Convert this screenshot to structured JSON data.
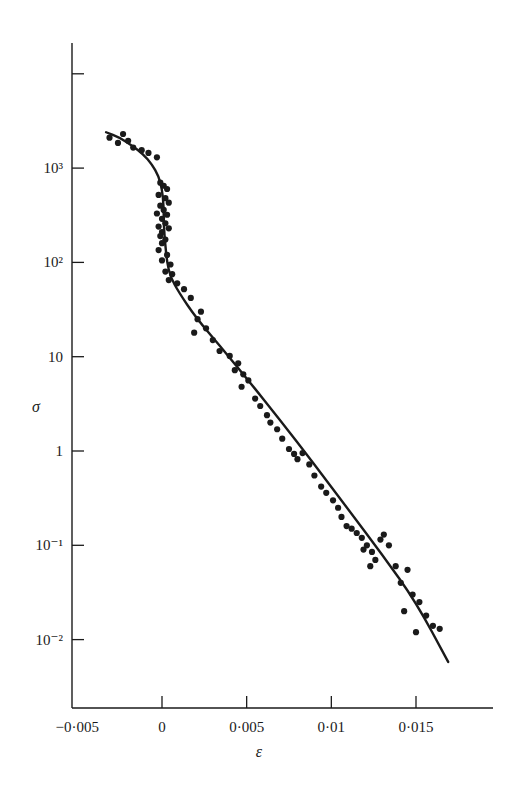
{
  "chart_data": {
    "type": "scatter",
    "title": "",
    "xlabel": "ε",
    "ylabel": "σ",
    "xscale": "linear",
    "yscale": "log",
    "xlim": [
      -0.005,
      0.019
    ],
    "ylim": [
      0.002,
      10000
    ],
    "grid": false,
    "legend": null,
    "x_ticks": [
      {
        "value": -0.005,
        "label": "−0·005"
      },
      {
        "value": 0,
        "label": "0"
      },
      {
        "value": 0.005,
        "label": "0·005"
      },
      {
        "value": 0.01,
        "label": "0·01"
      },
      {
        "value": 0.015,
        "label": "0·015"
      }
    ],
    "y_ticks": [
      {
        "value": 10000,
        "label": ""
      },
      {
        "value": 1000,
        "label": "10³"
      },
      {
        "value": 100,
        "label": "10²"
      },
      {
        "value": 10,
        "label": "10"
      },
      {
        "value": 1,
        "label": "1"
      },
      {
        "value": 0.1,
        "label": "10⁻¹"
      },
      {
        "value": 0.01,
        "label": "10⁻²"
      }
    ],
    "series": [
      {
        "name": "measured",
        "kind": "points",
        "points": [
          [
            -0.0031,
            2100
          ],
          [
            -0.0023,
            2300
          ],
          [
            -0.0026,
            1850
          ],
          [
            -0.002,
            1950
          ],
          [
            -0.0017,
            1650
          ],
          [
            -0.0012,
            1550
          ],
          [
            -0.0008,
            1450
          ],
          [
            -0.0003,
            1300
          ],
          [
            -0.0001,
            700
          ],
          [
            0.0001,
            650
          ],
          [
            0.0003,
            600
          ],
          [
            -0.0002,
            520
          ],
          [
            0.0002,
            480
          ],
          [
            0.0004,
            430
          ],
          [
            -0.0001,
            400
          ],
          [
            0.0001,
            360
          ],
          [
            -0.0003,
            330
          ],
          [
            0.0003,
            320
          ],
          [
            0.0,
            290
          ],
          [
            0.0002,
            260
          ],
          [
            -0.0002,
            240
          ],
          [
            0.0004,
            230
          ],
          [
            0.0,
            210
          ],
          [
            -0.0001,
            190
          ],
          [
            0.0002,
            175
          ],
          [
            0.0,
            160
          ],
          [
            -0.0002,
            135
          ],
          [
            0.0003,
            120
          ],
          [
            0.0,
            105
          ],
          [
            0.0005,
            95
          ],
          [
            0.0002,
            80
          ],
          [
            0.0006,
            75
          ],
          [
            0.0004,
            65
          ],
          [
            0.0009,
            60
          ],
          [
            0.0013,
            52
          ],
          [
            0.0017,
            42
          ],
          [
            0.0023,
            30
          ],
          [
            0.0021,
            25
          ],
          [
            0.0026,
            20
          ],
          [
            0.0019,
            18
          ],
          [
            0.003,
            15
          ],
          [
            0.0034,
            11.5
          ],
          [
            0.004,
            10.2
          ],
          [
            0.0045,
            8.5
          ],
          [
            0.0043,
            7.2
          ],
          [
            0.0048,
            6.5
          ],
          [
            0.0051,
            5.6
          ],
          [
            0.0047,
            4.8
          ],
          [
            0.0055,
            3.6
          ],
          [
            0.0058,
            3.0
          ],
          [
            0.0062,
            2.4
          ],
          [
            0.0064,
            2.0
          ],
          [
            0.0068,
            1.7
          ],
          [
            0.0071,
            1.35
          ],
          [
            0.0075,
            1.05
          ],
          [
            0.0078,
            0.93
          ],
          [
            0.008,
            0.82
          ],
          [
            0.0083,
            0.95
          ],
          [
            0.0087,
            0.72
          ],
          [
            0.009,
            0.55
          ],
          [
            0.0094,
            0.42
          ],
          [
            0.0097,
            0.36
          ],
          [
            0.0101,
            0.3
          ],
          [
            0.0104,
            0.25
          ],
          [
            0.0106,
            0.2
          ],
          [
            0.0109,
            0.16
          ],
          [
            0.0112,
            0.15
          ],
          [
            0.0115,
            0.135
          ],
          [
            0.0118,
            0.12
          ],
          [
            0.0121,
            0.1
          ],
          [
            0.0124,
            0.085
          ],
          [
            0.0119,
            0.09
          ],
          [
            0.0126,
            0.07
          ],
          [
            0.0123,
            0.06
          ],
          [
            0.0129,
            0.115
          ],
          [
            0.0131,
            0.13
          ],
          [
            0.0134,
            0.1
          ],
          [
            0.0138,
            0.06
          ],
          [
            0.0141,
            0.04
          ],
          [
            0.0145,
            0.055
          ],
          [
            0.0148,
            0.03
          ],
          [
            0.0152,
            0.025
          ],
          [
            0.0143,
            0.02
          ],
          [
            0.0156,
            0.018
          ],
          [
            0.016,
            0.014
          ],
          [
            0.0164,
            0.013
          ],
          [
            0.015,
            0.012
          ]
        ]
      },
      {
        "name": "fitted curve",
        "kind": "line",
        "points": [
          [
            -0.0033,
            2400
          ],
          [
            -0.0025,
            2100
          ],
          [
            -0.0018,
            1750
          ],
          [
            -0.0011,
            1400
          ],
          [
            -0.0006,
            1100
          ],
          [
            -0.0002,
            820
          ],
          [
            0.0,
            600
          ],
          [
            0.0001,
            400
          ],
          [
            0.0001,
            250
          ],
          [
            0.0002,
            150
          ],
          [
            0.0003,
            100
          ],
          [
            0.0005,
            70
          ],
          [
            0.001,
            48
          ],
          [
            0.002,
            26
          ],
          [
            0.0035,
            12.5
          ],
          [
            0.005,
            5.9
          ],
          [
            0.007,
            2.1
          ],
          [
            0.009,
            0.72
          ],
          [
            0.011,
            0.24
          ],
          [
            0.013,
            0.08
          ],
          [
            0.015,
            0.025
          ],
          [
            0.0169,
            0.0058
          ]
        ]
      }
    ]
  },
  "plot": {
    "x_origin_px": 162,
    "px_per_unit_x": 16933,
    "y_one_px": 451,
    "px_per_decade": 94.3,
    "axis_left_px": 72,
    "axis_bottom_px": 708,
    "axis_right_px": 493,
    "axis_top_px": 43
  }
}
